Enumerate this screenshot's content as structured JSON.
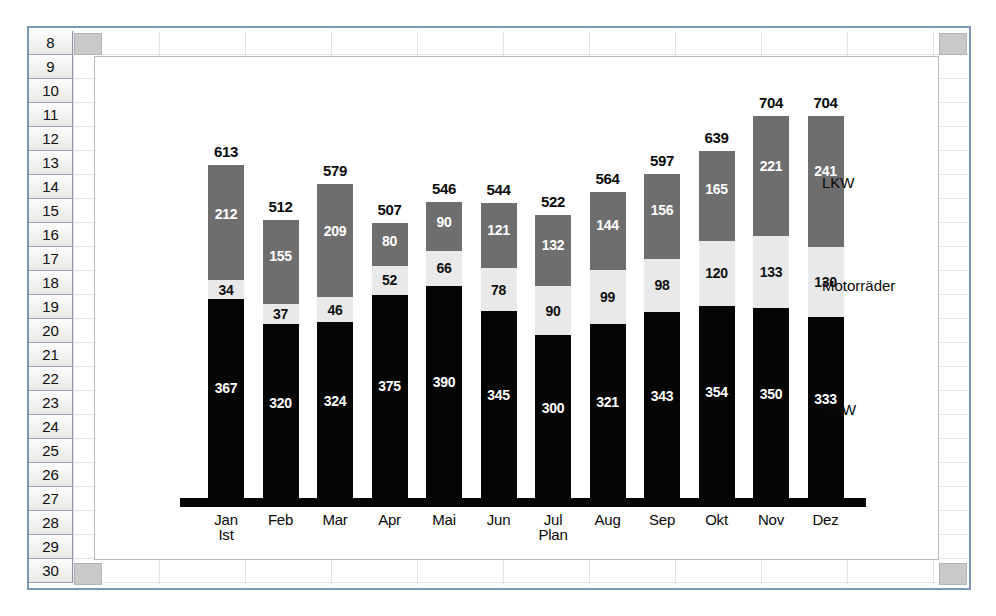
{
  "spreadsheet": {
    "row_headers": [
      "8",
      "9",
      "10",
      "11",
      "12",
      "13",
      "14",
      "15",
      "16",
      "17",
      "18",
      "19",
      "20",
      "21",
      "22",
      "23",
      "24",
      "25",
      "26",
      "27",
      "28",
      "29",
      "30"
    ]
  },
  "chart_data": {
    "type": "bar",
    "subtype": "stacked",
    "title": "",
    "xlabel": "",
    "ylabel": "",
    "grid": false,
    "legend_position": "right-inline",
    "axis_note_first": "Ist",
    "axis_note_mid": "Plan",
    "categories": [
      "Jan",
      "Feb",
      "Mar",
      "Apr",
      "Mai",
      "Jun",
      "Jul",
      "Aug",
      "Sep",
      "Okt",
      "Nov",
      "Dez"
    ],
    "series": [
      {
        "name": "PKW",
        "color": "#050505",
        "values": [
          367,
          320,
          324,
          375,
          390,
          345,
          300,
          321,
          343,
          354,
          350,
          333
        ]
      },
      {
        "name": "Motorräder",
        "color": "#e9e9e9",
        "values": [
          34,
          37,
          46,
          52,
          66,
          78,
          90,
          99,
          98,
          120,
          133,
          130
        ]
      },
      {
        "name": "LKW",
        "color": "#6e6e6e",
        "values": [
          212,
          155,
          209,
          80,
          90,
          121,
          132,
          144,
          156,
          165,
          221,
          241
        ]
      }
    ],
    "totals": [
      613,
      512,
      579,
      507,
      546,
      544,
      522,
      564,
      597,
      639,
      704,
      704
    ],
    "ymax": 704,
    "series_label_lkw": "LKW",
    "series_label_moto": "Motorräder",
    "series_label_pkw": "PKW"
  }
}
